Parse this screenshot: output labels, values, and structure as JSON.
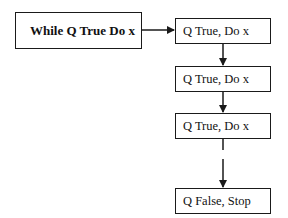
{
  "diagram": {
    "start": {
      "label": "While Q True Do x"
    },
    "steps": [
      {
        "label": "Q True, Do x"
      },
      {
        "label": "Q True, Do x"
      },
      {
        "label": "Q True, Do x"
      },
      {
        "label": "Q False, Stop"
      }
    ],
    "colors": {
      "stroke": "#1a1a1a",
      "fill": "#ffffff",
      "text": "#111111"
    }
  }
}
